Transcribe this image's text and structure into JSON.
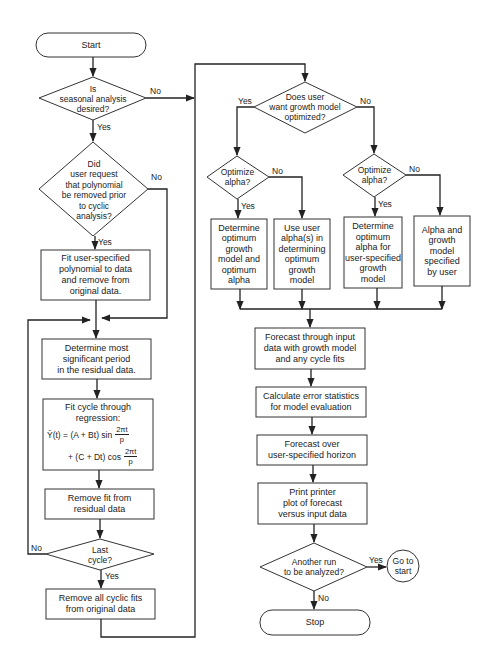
{
  "diagram": {
    "type": "flowchart",
    "nodes": {
      "start": {
        "shape": "terminal",
        "label": "Start"
      },
      "seasonal": {
        "shape": "decision",
        "label": "Is\nseasonal analysis\ndesired?"
      },
      "poly_request": {
        "shape": "decision",
        "label": "Did\nuser request\nthat polynomial\nbe removed prior\nto cyclic\nanalysis?"
      },
      "fit_poly": {
        "shape": "process",
        "label": "Fit user-specified\npolynomial to data\nand remove from\noriginal data."
      },
      "determine_period": {
        "shape": "process",
        "label": "Determine most\nsignificant period\nin the residual data."
      },
      "fit_cycle": {
        "shape": "process",
        "label": "Fit cycle through\nregression:",
        "formula": {
          "line1_left": "Ȳ(t) = (A + Bt) sin",
          "line1_num": "2πt",
          "line1_den": "p",
          "line2_left": "+ (C + Dt) cos",
          "line2_num": "2πt",
          "line2_den": "p"
        }
      },
      "remove_fit": {
        "shape": "process",
        "label": "Remove fit from\nresidual data"
      },
      "last_cycle": {
        "shape": "decision",
        "label": "Last\ncycle?"
      },
      "remove_all": {
        "shape": "process",
        "label": "Remove all cyclic fits\nfrom original data"
      },
      "growth_opt": {
        "shape": "decision",
        "label": "Does user\nwant growth model\noptimized?"
      },
      "opt_alpha_left": {
        "shape": "decision",
        "label": "Optimize\nalpha?"
      },
      "opt_alpha_right": {
        "shape": "decision",
        "label": "Optimize\nalpha?"
      },
      "det_opt_both": {
        "shape": "process",
        "label": "Determine\noptimum\ngrowth\nmodel and\noptimum\nalpha"
      },
      "use_user_alpha": {
        "shape": "process",
        "label": "Use user\nalpha(s) in\ndetermining\noptimum\ngrowth\nmodel"
      },
      "det_opt_alpha": {
        "shape": "process",
        "label": "Determine\noptimum\nalpha for\nuser-specified\ngrowth\nmodel"
      },
      "user_specified": {
        "shape": "process",
        "label": "Alpha and\ngrowth\nmodel\nspecified\nby user"
      },
      "forecast_input": {
        "shape": "process",
        "label": "Forecast through input\ndata with growth model\nand any cycle fits"
      },
      "calc_error": {
        "shape": "process",
        "label": "Calculate error statistics\nfor model evaluation"
      },
      "forecast_horizon": {
        "shape": "process",
        "label": "Forecast over\nuser-specified horizon"
      },
      "print_plot": {
        "shape": "process",
        "label": "Print printer\nplot of forecast\nversus input data"
      },
      "another_run": {
        "shape": "decision",
        "label": "Another run\nto be analyzed?"
      },
      "go_to_start": {
        "shape": "connector",
        "label": "Go to\nstart"
      },
      "stop": {
        "shape": "terminal",
        "label": "Stop"
      }
    },
    "edge_labels": {
      "seasonal_no": "No",
      "seasonal_yes": "Yes",
      "poly_no": "No",
      "poly_yes": "Yes",
      "last_no": "No",
      "last_yes": "Yes",
      "growth_yes": "Yes",
      "growth_no": "No",
      "alpha_left_no": "No",
      "alpha_left_yes": "Yes",
      "alpha_right_no": "No",
      "alpha_right_yes": "Yes",
      "another_yes": "Yes",
      "another_no": "No"
    }
  }
}
